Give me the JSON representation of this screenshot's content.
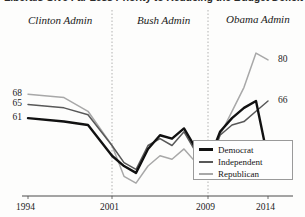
{
  "chart_data": {
    "type": "line",
    "title": "Liberals Give Far Less Priority to Reducing the Budget Deficit",
    "xlabel": "",
    "ylabel": "",
    "xlim": [
      1994,
      2014
    ],
    "ylim": [
      40,
      85
    ],
    "grid": false,
    "legend_position": "bottom-right",
    "x_ticks": [
      "1994",
      "2001",
      "2009",
      "2014"
    ],
    "x_tick_values": [
      1994,
      2001,
      2009,
      2014
    ],
    "annotations": [
      {
        "name": "era-clinton",
        "label": "Clinton Admin"
      },
      {
        "name": "era-bush",
        "label": "Bush Admin"
      },
      {
        "name": "era-obama",
        "label": "Obama Admin"
      }
    ],
    "dividers": [
      2001,
      2009
    ],
    "start_labels": [
      {
        "series": "Republican",
        "value": 68
      },
      {
        "series": "Independent",
        "value": 65
      },
      {
        "series": "Democrat",
        "value": 61
      }
    ],
    "end_labels": [
      {
        "series": "Republican",
        "value": 80
      },
      {
        "series": "Independent",
        "value": 66
      },
      {
        "series": "Democrat",
        "value": 49
      }
    ],
    "x": [
      1994,
      1997,
      1999,
      2001,
      2002,
      2003,
      2004,
      2005,
      2006,
      2007,
      2008,
      2009,
      2010,
      2011,
      2012,
      2013,
      2014
    ],
    "series": [
      {
        "name": "Democrat",
        "color": "#111111",
        "width": 2.4,
        "values": [
          61,
          60,
          59,
          50,
          47,
          45,
          52,
          56,
          55,
          58,
          52,
          48,
          57,
          61,
          64,
          66,
          49
        ]
      },
      {
        "name": "Independent",
        "color": "#585858",
        "width": 1.5,
        "values": [
          65,
          64,
          62,
          53,
          48,
          46,
          53,
          55,
          53,
          57,
          51,
          47,
          56,
          59,
          60,
          63,
          66
        ]
      },
      {
        "name": "Republican",
        "color": "#a8a8a8",
        "width": 1.5,
        "values": [
          68,
          67,
          63,
          53,
          44,
          42,
          47,
          50,
          49,
          52,
          48,
          45,
          56,
          63,
          70,
          80,
          78
        ]
      }
    ]
  },
  "legend": {
    "items": [
      {
        "label": "Democrat",
        "color": "#111111"
      },
      {
        "label": "Independent",
        "color": "#585858"
      },
      {
        "label": "Republican",
        "color": "#a8a8a8"
      }
    ]
  }
}
